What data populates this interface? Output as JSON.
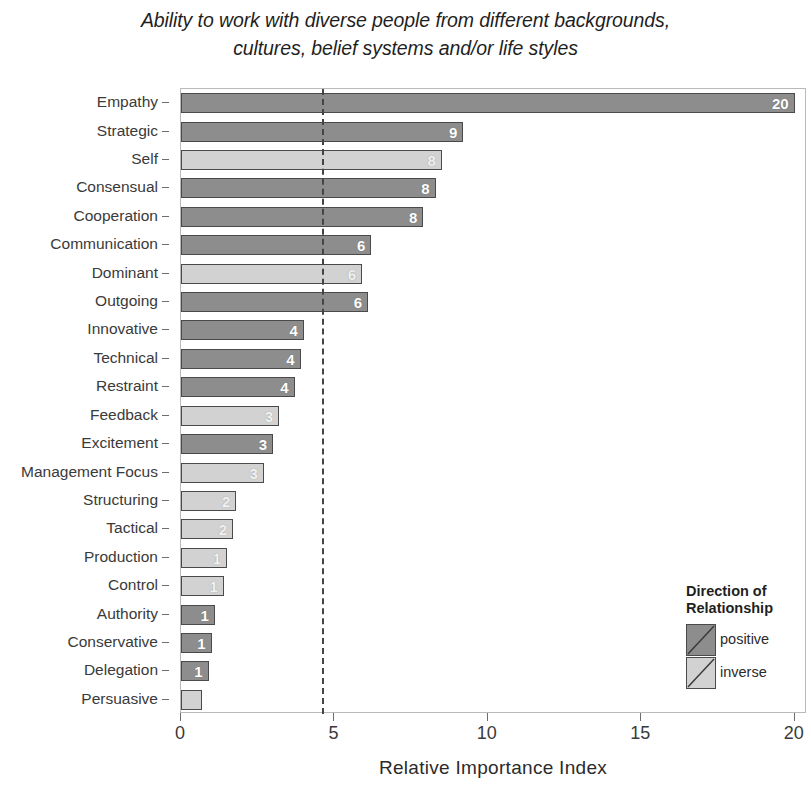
{
  "chart_data": {
    "type": "bar",
    "orientation": "horizontal",
    "title": "Ability to work with diverse people from different backgrounds, cultures, belief systems and/or life styles",
    "title_lines": [
      "Ability to work with diverse people from different backgrounds,",
      "cultures, belief systems and/or life styles"
    ],
    "xlabel": "Relative Importance Index",
    "ylabel": "",
    "xlim": [
      0,
      20.4
    ],
    "ylim": null,
    "xticks": [
      0,
      5,
      10,
      15,
      20
    ],
    "xtick_labels": [
      "0",
      "5",
      "10",
      "15",
      "20"
    ],
    "grid": false,
    "reference_line": {
      "value": 4.6,
      "style": "dashed",
      "color": "#444444"
    },
    "legend": {
      "title_lines": [
        "Direction of",
        "Relationship"
      ],
      "position": "bottom-right",
      "entries": [
        {
          "label": "positive",
          "color": "#8d8d8d",
          "key": "positive"
        },
        {
          "label": "inverse",
          "color": "#d2d2d2",
          "key": "inverse"
        }
      ]
    },
    "categories": [
      "Empathy",
      "Strategic",
      "Self",
      "Consensual",
      "Cooperation",
      "Communication",
      "Dominant",
      "Outgoing",
      "Innovative",
      "Technical",
      "Restraint",
      "Feedback",
      "Excitement",
      "Management Focus",
      "Structuring",
      "Tactical",
      "Production",
      "Control",
      "Authority",
      "Conservative",
      "Delegation",
      "Persuasive"
    ],
    "values": [
      20.0,
      9.2,
      8.5,
      8.3,
      7.9,
      6.2,
      5.9,
      6.1,
      4.0,
      3.9,
      3.7,
      3.2,
      3.0,
      2.7,
      1.8,
      1.7,
      1.5,
      1.4,
      1.1,
      1.0,
      0.9,
      0.7
    ],
    "data_labels": [
      "20",
      "9",
      "8",
      "8",
      "8",
      "6",
      "6",
      "6",
      "4",
      "4",
      "4",
      "3",
      "3",
      "3",
      "2",
      "2",
      "1",
      "1",
      "1",
      "1",
      "1",
      ""
    ],
    "directions": [
      "positive",
      "positive",
      "inverse",
      "positive",
      "positive",
      "positive",
      "inverse",
      "positive",
      "positive",
      "positive",
      "positive",
      "inverse",
      "positive",
      "inverse",
      "inverse",
      "inverse",
      "inverse",
      "inverse",
      "positive",
      "positive",
      "positive",
      "inverse"
    ],
    "colors": {
      "positive": "#8d8d8d",
      "inverse": "#d2d2d2",
      "bar_border": "#4a4a4a"
    }
  }
}
